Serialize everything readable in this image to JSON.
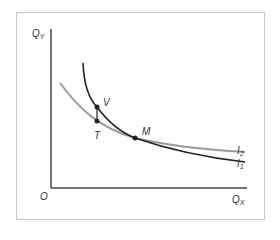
{
  "diagram": {
    "type": "indifference-curves",
    "axes": {
      "y_label": "Q",
      "y_sub": "Y",
      "x_label": "Q",
      "x_sub": "X",
      "origin_label": "O"
    },
    "curves": [
      {
        "name": "I",
        "sub": "1",
        "color": "#222222"
      },
      {
        "name": "I",
        "sub": "2",
        "color": "#999999"
      }
    ],
    "points": [
      {
        "label": "V"
      },
      {
        "label": "T"
      },
      {
        "label": "M"
      }
    ],
    "colors": {
      "axis": "#444444",
      "frame": "#c8c8c8",
      "curve_dark": "#222222",
      "curve_light": "#9a9a9a"
    }
  }
}
